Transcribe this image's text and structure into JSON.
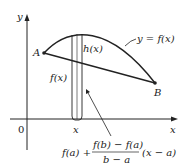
{
  "diagram": {
    "axes": {
      "x_label": "x",
      "y_label": "y",
      "origin_label": "0"
    },
    "curve_label": "y = f(x)",
    "points": [
      {
        "name": "A",
        "label": "A"
      },
      {
        "name": "B",
        "label": "B"
      }
    ],
    "strip": {
      "x_label": "x",
      "height_label": "h(x)",
      "lower_label": "f(x)"
    },
    "secant_formula": {
      "prefix": "f(a) +",
      "numerator": "f(b) − f(a)",
      "denominator": "b − a",
      "suffix": "(x − a)"
    },
    "colors": {
      "stroke": "#222222",
      "background": "#ffffff"
    }
  }
}
